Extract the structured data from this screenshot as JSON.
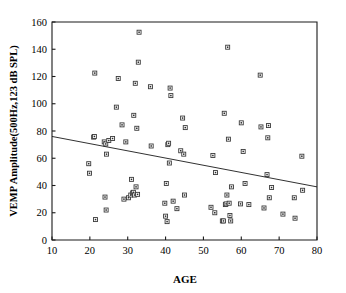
{
  "chart_data": {
    "type": "scatter",
    "title": "",
    "xlabel": "AGE",
    "ylabel": "VEMP Amplitude(500Hz,123 dB SPL)",
    "xlim": [
      10,
      80
    ],
    "ylim": [
      0,
      160
    ],
    "xticks": [
      10,
      20,
      30,
      40,
      50,
      60,
      70,
      80
    ],
    "yticks": [
      0,
      20,
      40,
      60,
      80,
      100,
      120,
      140,
      160
    ],
    "xtick_labels": [
      "10",
      "20",
      "30",
      "40",
      "50",
      "60",
      "70",
      "80"
    ],
    "ytick_labels": [
      "0",
      "20",
      "40",
      "60",
      "80",
      "100",
      "120",
      "140",
      "160"
    ],
    "grid": false,
    "legend": null,
    "marker": "open-square",
    "series": [
      {
        "name": "VEMP amplitude vs age",
        "points": [
          [
            19.7,
            56
          ],
          [
            19.9,
            49
          ],
          [
            21.0,
            75.5
          ],
          [
            21.2,
            76
          ],
          [
            21.3,
            122.5
          ],
          [
            21.5,
            15
          ],
          [
            23.8,
            72
          ],
          [
            24.0,
            31.5
          ],
          [
            24.2,
            70.5
          ],
          [
            24.3,
            22
          ],
          [
            24.4,
            63
          ],
          [
            25.0,
            73
          ],
          [
            26.0,
            74.5
          ],
          [
            27.0,
            97.5
          ],
          [
            27.5,
            118.5
          ],
          [
            28.5,
            84.5
          ],
          [
            29.0,
            30
          ],
          [
            29.5,
            72
          ],
          [
            30.2,
            31
          ],
          [
            30.8,
            33
          ],
          [
            31.0,
            44.5
          ],
          [
            31.3,
            34.5
          ],
          [
            31.5,
            35
          ],
          [
            31.6,
            91.5
          ],
          [
            31.8,
            33
          ],
          [
            32.0,
            115
          ],
          [
            32.2,
            39
          ],
          [
            32.4,
            82
          ],
          [
            32.6,
            33.5
          ],
          [
            32.8,
            130.5
          ],
          [
            33.0,
            152.5
          ],
          [
            36.0,
            112.5
          ],
          [
            36.2,
            69
          ],
          [
            39.8,
            27
          ],
          [
            40.0,
            17.5
          ],
          [
            40.2,
            41.5
          ],
          [
            40.4,
            13.5
          ],
          [
            40.6,
            70
          ],
          [
            40.8,
            71
          ],
          [
            41.0,
            56.5
          ],
          [
            41.2,
            111.5
          ],
          [
            41.4,
            106
          ],
          [
            42.0,
            28.5
          ],
          [
            43.0,
            23
          ],
          [
            44.0,
            65.5
          ],
          [
            44.5,
            89.5
          ],
          [
            44.8,
            63
          ],
          [
            45.0,
            33
          ],
          [
            45.2,
            82.5
          ],
          [
            52.0,
            24
          ],
          [
            52.5,
            62
          ],
          [
            53.0,
            20
          ],
          [
            53.2,
            49.5
          ],
          [
            55.0,
            14
          ],
          [
            55.3,
            14
          ],
          [
            55.5,
            93
          ],
          [
            55.8,
            26
          ],
          [
            56.0,
            26.5
          ],
          [
            56.2,
            33
          ],
          [
            56.4,
            141.5
          ],
          [
            56.6,
            74
          ],
          [
            56.8,
            27
          ],
          [
            57.0,
            18
          ],
          [
            57.2,
            14
          ],
          [
            57.4,
            39
          ],
          [
            59.8,
            26.5
          ],
          [
            60.0,
            86
          ],
          [
            60.5,
            65
          ],
          [
            61.0,
            41.5
          ],
          [
            62.0,
            26
          ],
          [
            65.0,
            121
          ],
          [
            65.2,
            83
          ],
          [
            66.0,
            23.5
          ],
          [
            66.8,
            48
          ],
          [
            67.0,
            75
          ],
          [
            67.2,
            84
          ],
          [
            67.4,
            31
          ],
          [
            68.0,
            38.5
          ],
          [
            71.0,
            19
          ],
          [
            74.0,
            31
          ],
          [
            74.2,
            16
          ],
          [
            76.0,
            61.5
          ],
          [
            76.2,
            36.5
          ]
        ]
      }
    ],
    "trendline": {
      "name": "linear-fit",
      "x_start": 10,
      "y_start": 76,
      "x_end": 80,
      "y_end": 39
    }
  },
  "axis": {
    "x_title": "AGE",
    "y_title": "VEMP Amplitude(500Hz,123 dB SPL)"
  },
  "colors": {
    "background": "#ffffff",
    "axis": "#1a1a1a",
    "marker_edge": "#3a3a3a",
    "marker_face": "#ffffff",
    "trendline": "#1a1a1a"
  }
}
